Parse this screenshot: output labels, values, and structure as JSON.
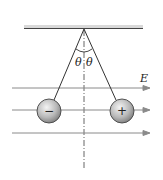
{
  "diagram": {
    "labels": {
      "theta_left": "θ",
      "theta_right": "θ",
      "field": "E",
      "charge_left": "−",
      "charge_right": "+"
    },
    "colors": {
      "line": "#333333",
      "field_line": "#8a8a8a",
      "ball_fill": "#bdbdbd",
      "ceiling": "#444444"
    }
  }
}
